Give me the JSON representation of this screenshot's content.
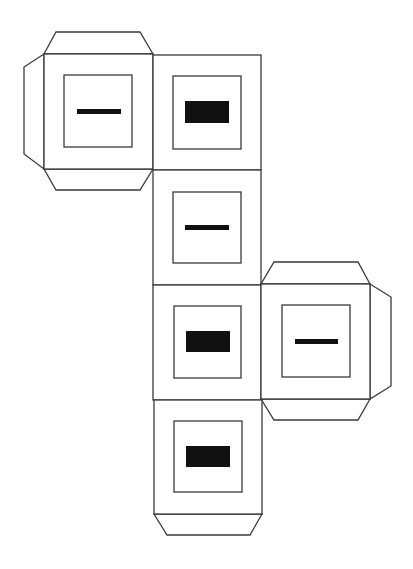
{
  "diagram": {
    "colors": {
      "stroke": "#3a3a3a",
      "mark": "#111111",
      "background": "#ffffff"
    },
    "faces": [
      {
        "id": "face-top-left",
        "mark": "thin-bar",
        "tabs": [
          "top",
          "left",
          "bottom"
        ]
      },
      {
        "id": "face-top-center",
        "mark": "thick-block",
        "tabs": []
      },
      {
        "id": "face-middle-1",
        "mark": "thin-bar",
        "tabs": []
      },
      {
        "id": "face-middle-2",
        "mark": "thick-block",
        "tabs": []
      },
      {
        "id": "face-right",
        "mark": "thin-bar",
        "tabs": [
          "top",
          "right",
          "bottom"
        ]
      },
      {
        "id": "face-bottom",
        "mark": "thick-block",
        "tabs": [
          "bottom"
        ]
      }
    ]
  }
}
